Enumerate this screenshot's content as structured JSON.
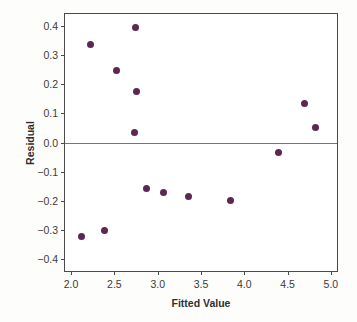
{
  "chart_data": {
    "type": "scatter",
    "title": "",
    "xlabel": "Fitted Value",
    "ylabel": "Residual",
    "xlim": [
      1.93,
      5.07
    ],
    "ylim": [
      -0.44,
      0.44
    ],
    "xticks": [
      2.0,
      2.5,
      3.0,
      3.5,
      4.0,
      4.5,
      5.0
    ],
    "xticklabels": [
      "2.0",
      "2.5",
      "3.0",
      "3.5",
      "4.0",
      "4.5",
      "5.0"
    ],
    "yticks": [
      0.4,
      0.3,
      0.2,
      0.1,
      0.0,
      -0.1,
      -0.2,
      -0.3,
      -0.4
    ],
    "yticklabels": [
      "0.4",
      "0.3",
      "0.2",
      "0.1",
      "0.0",
      "−0.1",
      "−0.2",
      "−0.3",
      "−0.4"
    ],
    "grid": false,
    "legend": false,
    "marker_color": "#5e2750",
    "reference_line": {
      "y": 0.0,
      "color": "#4a7db5",
      "orientation": "horizontal"
    },
    "points": [
      {
        "x": 2.12,
        "y": -0.322
      },
      {
        "x": 2.23,
        "y": 0.336
      },
      {
        "x": 2.39,
        "y": -0.303
      },
      {
        "x": 2.52,
        "y": 0.246
      },
      {
        "x": 2.73,
        "y": 0.034
      },
      {
        "x": 2.74,
        "y": 0.395
      },
      {
        "x": 2.75,
        "y": 0.174
      },
      {
        "x": 2.87,
        "y": -0.156
      },
      {
        "x": 3.07,
        "y": -0.172
      },
      {
        "x": 3.36,
        "y": -0.184
      },
      {
        "x": 3.84,
        "y": -0.198
      },
      {
        "x": 4.4,
        "y": -0.034
      },
      {
        "x": 4.7,
        "y": 0.135
      },
      {
        "x": 4.82,
        "y": 0.053
      }
    ]
  }
}
